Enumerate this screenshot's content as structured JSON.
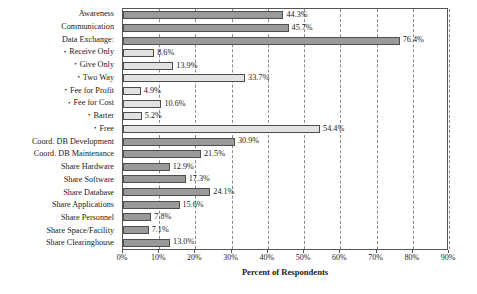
{
  "chart_data": {
    "type": "bar",
    "orientation": "horizontal",
    "title": "",
    "xlabel": "Percent of Respondents",
    "ylabel": "",
    "xlim": [
      0,
      90
    ],
    "xticks": [
      0,
      10,
      20,
      30,
      40,
      50,
      60,
      70,
      80,
      90
    ],
    "xticklabels": [
      "0%",
      "10%",
      "20%",
      "30%",
      "40%",
      "50%",
      "60%",
      "70%",
      "80%",
      "90%"
    ],
    "grid": "vertical-dashed",
    "legend": "none",
    "categories": [
      "Awareness",
      "Communication",
      "Data Exchange:",
      "Receive Only",
      "Give Only",
      "Two Way",
      "Fee for Profit",
      "Fee for Cost",
      "Barter",
      "Free",
      "Coord. DB Development",
      "Coord. DB Maintenance",
      "Share Hardware",
      "Share Software",
      "Share Database",
      "Share Applications",
      "Share Personnel",
      "Share Space/Facility",
      "Share Clearinghouse"
    ],
    "values": [
      44.3,
      45.7,
      76.4,
      8.6,
      13.9,
      33.7,
      4.9,
      10.6,
      5.2,
      54.4,
      30.9,
      21.5,
      12.9,
      17.3,
      24.1,
      15.6,
      7.8,
      7.1,
      13.0
    ],
    "value_labels": [
      "44.3%",
      "45.7%",
      "76.4%",
      "8.6%",
      "13.9%",
      "33.7%",
      "4.9%",
      "10.6%",
      "5.2%",
      "54.4%",
      "30.9%",
      "21.5%",
      "12.9%",
      "17.3%",
      "24.1%",
      "15.6%",
      "7.8%",
      "7.1%",
      "13.0%"
    ],
    "sub_item": [
      false,
      false,
      false,
      true,
      true,
      true,
      true,
      true,
      true,
      true,
      false,
      false,
      false,
      false,
      false,
      false,
      false,
      false,
      false
    ],
    "shade": [
      "dark",
      "dark",
      "dark",
      "light",
      "light",
      "light",
      "light",
      "light",
      "light",
      "light",
      "dark",
      "dark",
      "dark",
      "dark",
      "dark",
      "dark",
      "dark",
      "dark",
      "dark"
    ],
    "colors": {
      "dark_bar": "#9a9a9a",
      "light_bar": "#e2e2e2",
      "bar_edge": "#4d4d4d",
      "gridline": "#8a8a8a",
      "axis": "#555555",
      "text": "#1a1a1a",
      "background": "#ffffff"
    }
  }
}
